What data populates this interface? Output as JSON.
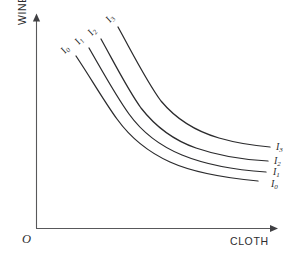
{
  "figure": {
    "origin_label": "O",
    "axes": {
      "y_label": "WINE",
      "x_label": "CLOTH",
      "y_axis_name": "vertical-axis",
      "x_axis_name": "horizontal-axis",
      "arrowheads": true,
      "tick_labels": [],
      "gridlines": false,
      "axis_color": "#58585a"
    },
    "curve_color": "#2b2b2d"
  },
  "curves": [
    {
      "id": "I0",
      "base": "I",
      "subscript": "0",
      "label_left": "I",
      "label_left_sub": "0",
      "label_right": "I",
      "label_right_sub": "0",
      "path": "M 76,56 C 92,80 104,101 117,119 C 130,137 148,152 170,162 C 192,172 226,178 258,181",
      "left_label_xy": [
        65,
        54
      ],
      "right_label_xy": [
        271,
        186
      ]
    },
    {
      "id": "I1",
      "base": "I",
      "subscript": "1",
      "label_left": "I",
      "label_left_sub": "1",
      "label_right": "I",
      "label_right_sub": "1",
      "path": "M 89,48 C 104,74 116,96 129,114 C 142,132 160,146 182,155 C 204,164 236,170 266,172",
      "left_label_xy": [
        79,
        45
      ],
      "right_label_xy": [
        273,
        174
      ]
    },
    {
      "id": "I2",
      "base": "I",
      "subscript": "2",
      "label_left": "I",
      "label_left_sub": "2",
      "label_right": "I",
      "label_right_sub": "2",
      "path": "M 101,39 C 116,66 128,90 141,108 C 155,126 173,140 196,148 C 219,156 247,160 268,161",
      "left_label_xy": [
        92,
        36
      ],
      "right_label_xy": [
        274,
        163
      ]
    },
    {
      "id": "I3",
      "base": "I",
      "subscript": "3",
      "label_left": "I",
      "label_left_sub": "3",
      "label_right": "I",
      "label_right_sub": "3",
      "path": "M 118,27 C 134,56 147,82 161,101 C 176,119 195,131 219,138 C 240,144 258,146 270,147",
      "left_label_xy": [
        110,
        23
      ],
      "right_label_xy": [
        276,
        149
      ]
    }
  ],
  "chart_data": {
    "type": "line",
    "xlabel": "CLOTH",
    "ylabel": "WINE",
    "xlim": [
      0,
      1
    ],
    "ylim": [
      0,
      1
    ],
    "grid": false,
    "legend_position": "inline-end-of-curve",
    "annotations": [
      "O"
    ],
    "series": [
      {
        "name": "I0",
        "x": [
          0.17,
          0.27,
          0.35,
          0.44,
          0.57,
          0.7,
          0.83,
          0.96
        ],
        "y": [
          0.8,
          0.63,
          0.52,
          0.42,
          0.31,
          0.26,
          0.23,
          0.22
        ]
      },
      {
        "name": "I1",
        "x": [
          0.22,
          0.32,
          0.4,
          0.49,
          0.62,
          0.75,
          0.88,
          1.0
        ],
        "y": [
          0.84,
          0.67,
          0.56,
          0.46,
          0.36,
          0.31,
          0.28,
          0.27
        ]
      },
      {
        "name": "I2",
        "x": [
          0.27,
          0.37,
          0.45,
          0.54,
          0.67,
          0.8,
          0.93,
          1.02
        ],
        "y": [
          0.88,
          0.72,
          0.61,
          0.51,
          0.41,
          0.36,
          0.33,
          0.32
        ]
      },
      {
        "name": "I3",
        "x": [
          0.34,
          0.44,
          0.53,
          0.62,
          0.75,
          0.88,
          1.0,
          1.04
        ],
        "y": [
          0.93,
          0.78,
          0.67,
          0.57,
          0.47,
          0.42,
          0.39,
          0.38
        ]
      }
    ]
  }
}
